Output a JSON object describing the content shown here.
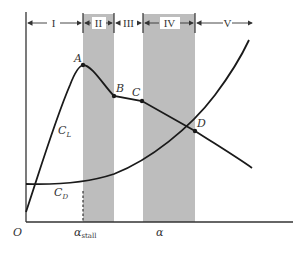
{
  "figure": {
    "colors": {
      "line": "#1a1a1a",
      "band": "#bdbdbd",
      "text": "#333333",
      "background": "#ffffff"
    },
    "regions": [
      {
        "label": "I",
        "x0": 26,
        "x1": 83,
        "shaded": false
      },
      {
        "label": "II",
        "x0": 83,
        "x1": 114,
        "shaded": true
      },
      {
        "label": "III",
        "x0": 114,
        "x1": 143,
        "shaded": false
      },
      {
        "label": "IV",
        "x0": 143,
        "x1": 195,
        "shaded": true
      },
      {
        "label": "V",
        "x0": 195,
        "x1": 252,
        "shaded": false
      }
    ],
    "points": [
      {
        "label": "A",
        "x": 83,
        "y": 65
      },
      {
        "label": "B",
        "x": 114,
        "y": 96
      },
      {
        "label": "C",
        "x": 142,
        "y": 101
      },
      {
        "label": "D",
        "x": 195,
        "y": 131
      }
    ],
    "curves": {
      "lift": {
        "label": "C",
        "sub": "L"
      },
      "drag": {
        "label": "C",
        "sub": "D"
      }
    },
    "axes": {
      "origin_label": "O",
      "stall_label": "α",
      "stall_sub": "stall",
      "x_label": "α"
    }
  }
}
